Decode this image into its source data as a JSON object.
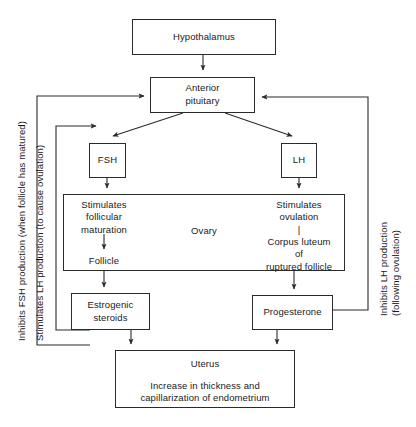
{
  "diagram": {
    "stroke_color": "#2b2b2b",
    "text_color": "#1a1a1a",
    "background": "#ffffff"
  },
  "boxes": {
    "hypothalamus": "Hypothalamus",
    "pituitary": "Anterior\npituitary",
    "fsh": "FSH",
    "lh": "LH",
    "ovary_label": "Ovary",
    "ovary_left": "Stimulates\nfollicular\nmaturation",
    "follicle": "Follicle",
    "ovary_right": "Stimulates\novulation\n|\nCorpus luteum\nof\nruptured follicle",
    "estrogenic_steroids": "Estrogenic\nsteroids",
    "progesterone": "Progesterone",
    "uterus_title": "Uterus",
    "uterus_body": "Increase in thickness and\ncapillarization of endometrium"
  },
  "feedback_labels": {
    "inhibits_fsh": "Inhibits FSH production (when follicle has matured)",
    "stimulates_lh": "Stimulates LH production (to cause ovulation)",
    "inhibits_lh": "Inhibits LH production\n(following ovulation)"
  },
  "arrows": [
    {
      "name": "hypothalamus-to-pituitary",
      "from": "hypothalamus",
      "to": "pituitary"
    },
    {
      "name": "pituitary-to-fsh",
      "from": "pituitary",
      "to": "fsh"
    },
    {
      "name": "pituitary-to-lh",
      "from": "pituitary",
      "to": "lh"
    },
    {
      "name": "fsh-to-ovary",
      "from": "fsh",
      "to": "ovary"
    },
    {
      "name": "lh-to-ovary",
      "from": "lh",
      "to": "ovary"
    },
    {
      "name": "follicular-maturation-to-follicle",
      "from": "ovary_left",
      "to": "follicle"
    },
    {
      "name": "follicle-to-estrogenic-steroids",
      "from": "follicle",
      "to": "estrogenic_steroids"
    },
    {
      "name": "corpus-luteum-to-progesterone",
      "from": "ovary_right",
      "to": "progesterone"
    },
    {
      "name": "estrogenic-steroids-to-uterus",
      "from": "estrogenic_steroids",
      "to": "uterus"
    },
    {
      "name": "progesterone-to-uterus",
      "from": "progesterone",
      "to": "uterus"
    },
    {
      "name": "estrogen-feedback-inhibits-fsh",
      "from": "estrogenic_steroids",
      "to": "pituitary"
    },
    {
      "name": "estrogen-feedback-stimulates-lh",
      "from": "estrogenic_steroids",
      "to": "pituitary"
    },
    {
      "name": "progesterone-feedback-inhibits-lh",
      "from": "progesterone",
      "to": "pituitary"
    }
  ]
}
